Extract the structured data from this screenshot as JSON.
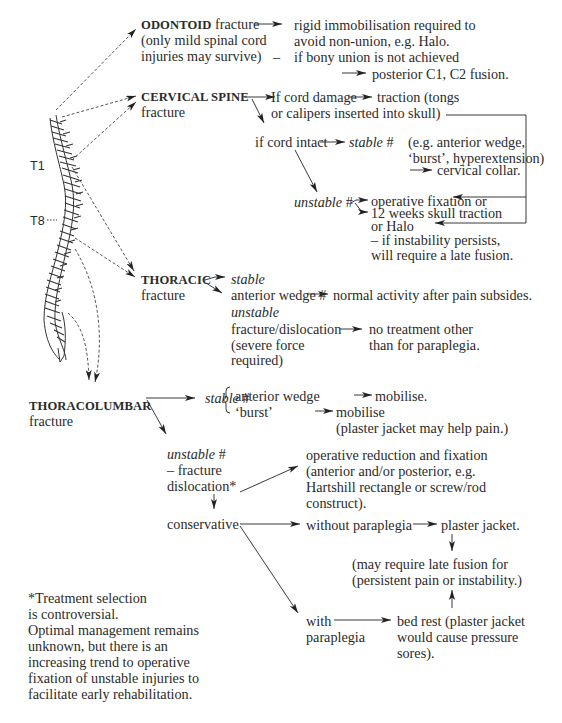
{
  "spine_labels": {
    "t1": "T1",
    "t8": "T8"
  },
  "odontoid": {
    "title": "ODONTOID",
    "title_suffix": "fracture",
    "sub1": "(only mild spinal cord",
    "sub2": "injuries may survive)",
    "treat1": "rigid immobilisation required to",
    "treat2": "avoid non-union, e.g. Halo.",
    "dash": "–",
    "treat3": "if bony union is not achieved",
    "treat4": "posterior C1, C2 fusion."
  },
  "cervical": {
    "title": "CERVICAL SPINE",
    "sub": "fracture",
    "cord_damage": "If cord damage",
    "traction1": "traction (tongs",
    "traction2": "or calipers inserted into skull)",
    "cord_intact": "if cord intact",
    "stable": "stable",
    "hash": "#",
    "stable_eg1": "(e.g. anterior wedge,",
    "stable_eg2": "‘burst’, hyperextension)",
    "collar": "cervical collar.",
    "unstable": "unstable",
    "op1": "operative fixation or",
    "op2": "12 weeks skull traction",
    "op3": "or Halo",
    "op4": "– if instability persists,",
    "op5": "will require a late fusion."
  },
  "thoracic": {
    "title": "THORACIC",
    "sub": "fracture",
    "stable": "stable",
    "wedge": "anterior wedge #",
    "normal": "normal activity after pain subsides.",
    "unstable": "unstable",
    "fd": "fracture/dislocation",
    "force1": "(severe force",
    "force2": "required)",
    "no_treat1": "no treatment other",
    "no_treat2": "than for paraplegia."
  },
  "thoracolumbar": {
    "title": "THORACOLUMBAR",
    "sub": "fracture",
    "stable": "stable",
    "hash": "#",
    "wedge": "anterior wedge",
    "mob1": "mobilise.",
    "burst": "‘burst’",
    "mob2": "mobilise",
    "mob2_note": "(plaster jacket may help pain.)",
    "unstable": "unstable",
    "fd1": "– fracture",
    "fd2": "dislocation*",
    "op1": "operative reduction and fixation",
    "op2": "(anterior and/or posterior, e.g.",
    "op3": "Hartshill rectangle or screw/rod",
    "op4": "construct).",
    "conservative": "conservative",
    "without": "without paraplegia",
    "jacket": "plaster jacket.",
    "late1": "(may require late fusion for",
    "late2": "(persistent pain or instability.)",
    "with1": "with",
    "with2": "paraplegia",
    "bed1": "bed rest (plaster jacket",
    "bed2": "would cause pressure",
    "bed3": "sores)."
  },
  "footnote": {
    "l1": "*Treatment selection",
    "l2": "is controversial.",
    "l3": "Optimal management remains",
    "l4": "unknown, but there is an",
    "l5": "increasing trend to operative",
    "l6": "fixation of unstable injuries to",
    "l7": "facilitate early rehabilitation."
  }
}
